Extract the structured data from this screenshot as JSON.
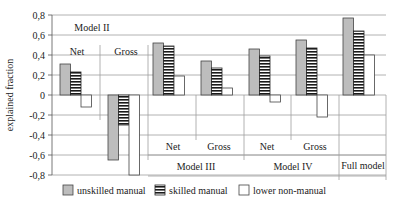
{
  "chart_data": {
    "type": "bar",
    "title": "",
    "xlabel": "",
    "ylabel": "explained fraction",
    "ylim": [
      -0.8,
      0.8
    ],
    "yticks": [
      "0,8",
      "0,6",
      "0,4",
      "0,2",
      "0",
      "-0,2",
      "-0,4",
      "-0,6",
      "-0,8"
    ],
    "grid": true,
    "legend_position": "bottom",
    "categories": [
      "Model II Net",
      "Model II Gross",
      "Model III Net",
      "Model III Gross",
      "Model IV Net",
      "Model IV Gross",
      "Full model"
    ],
    "category_labels": {
      "model_ii": "Model II",
      "model_iii": "Model III",
      "model_iv": "Model IV",
      "full_model": "Full model",
      "net": "Net",
      "gross": "Gross"
    },
    "series": [
      {
        "name": "unskilled manual",
        "values": [
          0.31,
          -0.65,
          0.52,
          0.34,
          0.46,
          0.55,
          0.77
        ]
      },
      {
        "name": "skilled manual",
        "values": [
          0.23,
          -0.3,
          0.49,
          0.27,
          0.39,
          0.47,
          0.64
        ]
      },
      {
        "name": "lower non-manual",
        "values": [
          -0.12,
          -0.8,
          0.19,
          0.07,
          -0.07,
          -0.22,
          0.4
        ]
      }
    ],
    "colors": {
      "unskilled manual": "#bdbdbd",
      "skilled manual": "#1a1a1a",
      "lower non-manual": "#ffffff",
      "grid": "#a0a0a0",
      "axis": "#555555"
    }
  }
}
